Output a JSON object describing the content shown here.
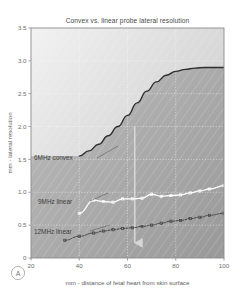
{
  "figure": {
    "panel_label": "A",
    "background_color": "#ffffff"
  },
  "chart_data": {
    "type": "line",
    "title": "Convex vs. linear probe lateral resolution",
    "xlabel": "mm - distance of fetal heart from skin surface",
    "ylabel": "mm - lateral resolution",
    "xlim": [
      20,
      100
    ],
    "ylim": [
      0,
      3.5
    ],
    "xticks": [
      20,
      40,
      60,
      80,
      100
    ],
    "yticks": [
      "0",
      "0.5",
      "1.0",
      "1.5",
      "2.0",
      "2.5",
      "3.0",
      "3.5"
    ],
    "ytick_values": [
      0,
      0.5,
      1.0,
      1.5,
      2.0,
      2.5,
      3.0,
      3.5
    ],
    "grid": true,
    "grid_color": "#ffffff",
    "legend_position": "inline-annotations",
    "series": [
      {
        "name": "6MHz convex",
        "label": "6MHz convex",
        "color": "#2e2e2e",
        "style": "solid",
        "line_width": 1.4,
        "markers": false,
        "fill_below": true,
        "fill_color": "#8f8f8f",
        "x": [
          40,
          44,
          48,
          52,
          56,
          60,
          64,
          68,
          72,
          76,
          80,
          84,
          88,
          92,
          96,
          100
        ],
        "y": [
          1.55,
          1.63,
          1.73,
          1.86,
          2.0,
          2.17,
          2.36,
          2.54,
          2.68,
          2.78,
          2.84,
          2.87,
          2.89,
          2.9,
          2.9,
          2.9
        ]
      },
      {
        "name": "9MHz linear",
        "label": "9MHz linear",
        "color": "#ffffff",
        "style": "solid",
        "line_width": 1.3,
        "markers": true,
        "x": [
          40,
          46,
          50,
          54,
          58,
          62,
          66,
          70,
          74,
          78,
          82,
          86,
          90,
          94,
          100
        ],
        "y": [
          0.68,
          0.88,
          0.86,
          0.85,
          0.9,
          0.9,
          0.91,
          0.97,
          0.94,
          0.95,
          0.96,
          0.99,
          1.02,
          1.05,
          1.1
        ]
      },
      {
        "name": "12MHz linear",
        "label": "12MHz linear",
        "color": "#3f3f3f",
        "style": "dotted",
        "line_width": 1.0,
        "markers": true,
        "x": [
          34,
          40,
          46,
          50,
          54,
          58,
          62,
          66,
          70,
          74,
          78,
          82,
          86,
          90,
          94,
          100
        ],
        "y": [
          0.27,
          0.33,
          0.38,
          0.41,
          0.43,
          0.45,
          0.46,
          0.48,
          0.5,
          0.53,
          0.56,
          0.57,
          0.6,
          0.62,
          0.65,
          0.68
        ]
      }
    ],
    "annotations": [
      {
        "name": "depth-marker-arrow",
        "type": "vertical-arrow",
        "x": 63,
        "y_from": 2.0,
        "y_to": 0.23,
        "color": "#d6d6d6"
      }
    ]
  }
}
